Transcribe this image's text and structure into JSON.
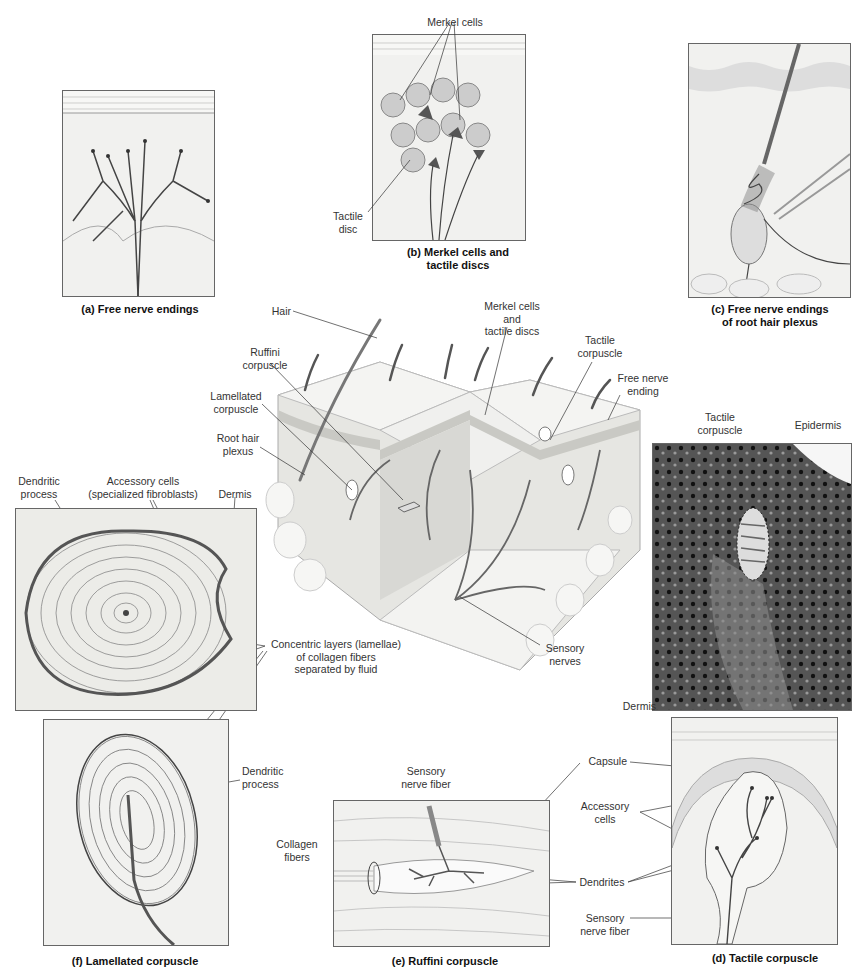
{
  "panels": {
    "a": {
      "caption": "(a) Free nerve endings"
    },
    "b": {
      "caption_line1": "(b) Merkel cells and",
      "caption_line2": "tactile discs",
      "labels": {
        "merkel_cells": "Merkel cells",
        "tactile_disc_1": "Tactile",
        "tactile_disc_2": "disc"
      }
    },
    "c": {
      "caption_line1": "(c) Free nerve endings",
      "caption_line2": "of root hair plexus"
    },
    "d": {
      "caption": "(d) Tactile corpuscle",
      "labels": {
        "capsule": "Capsule",
        "accessory_1": "Accessory",
        "accessory_2": "cells",
        "dendrites": "Dendrites",
        "sensory_1": "Sensory",
        "sensory_2": "nerve fiber"
      }
    },
    "e": {
      "caption": "(e) Ruffini corpuscle",
      "labels": {
        "sensory_1": "Sensory",
        "sensory_2": "nerve fiber",
        "collagen_1": "Collagen",
        "collagen_2": "fibers"
      }
    },
    "f": {
      "caption": "(f) Lamellated corpuscle",
      "labels": {
        "dendritic_1": "Dendritic",
        "dendritic_2": "process"
      }
    },
    "micrograph_lamellated": {
      "labels": {
        "dendritic_1": "Dendritic",
        "dendritic_2": "process",
        "accessory_1": "Accessory cells",
        "accessory_2": "(specialized fibroblasts)",
        "dermis": "Dermis",
        "concentric_1": "Concentric layers (lamellae)",
        "concentric_2": "of collagen fibers",
        "concentric_3": "separated by fluid"
      }
    },
    "micrograph_tactile": {
      "labels": {
        "tactile_1": "Tactile",
        "tactile_2": "corpuscle",
        "epidermis": "Epidermis",
        "dermis": "Dermis"
      }
    },
    "skin_block": {
      "labels": {
        "hair": "Hair",
        "ruffini_1": "Ruffini",
        "ruffini_2": "corpuscle",
        "lamellated_1": "Lamellated",
        "lamellated_2": "corpuscle",
        "root_hair_1": "Root hair",
        "root_hair_2": "plexus",
        "merkel_1": "Merkel cells",
        "merkel_2": "and",
        "merkel_3": "tactile discs",
        "tactile_1": "Tactile",
        "tactile_2": "corpuscle",
        "free_nerve_1": "Free nerve",
        "free_nerve_2": "ending",
        "sensory_1": "Sensory",
        "sensory_2": "nerves"
      }
    }
  },
  "colors": {
    "line": "#333333",
    "panel_bg": "#f1f1ef",
    "nerve": "#4a4a4a",
    "micrograph_dark": "#3a3a3a"
  }
}
